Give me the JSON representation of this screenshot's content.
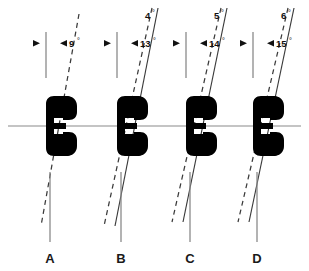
{
  "figure": {
    "type": "technical-cross-section-diagram",
    "background_color": "#ffffff",
    "centerline_color": "#8a8a8a",
    "reference_line_color": "#8a8a8a",
    "tilt_line_color": "#3a3a3a",
    "seal_fill_color": "#000000",
    "label_color": "#1a1a1a"
  },
  "centerline": {
    "label": "horizontal-centerline",
    "y": 126
  },
  "groups": [
    {
      "id": "A",
      "label": "A",
      "label_x": 50,
      "label_y": 260,
      "ref_x": 46,
      "leader_x": 50,
      "primary_angle": "9",
      "primary_angle_unit": "°",
      "primary_angle_x": 73,
      "primary_angle_y": 45,
      "secondary_angle": null,
      "secondary_angle_unit": null,
      "seal_center_x": 68,
      "tilt_dashed_deg": 9,
      "tilt_solid_deg": null
    },
    {
      "id": "B",
      "label": "B",
      "label_x": 121,
      "label_y": 260,
      "ref_x": 117,
      "leader_x": 121,
      "primary_angle": "13",
      "primary_angle_unit": "°",
      "primary_angle_x": 144,
      "primary_angle_y": 45,
      "secondary_angle": "4",
      "secondary_angle_unit": "°",
      "secondary_angle_x": 142,
      "secondary_angle_y": 17,
      "seal_center_x": 139,
      "tilt_dashed_deg": 13,
      "tilt_solid_deg": 9
    },
    {
      "id": "C",
      "label": "C",
      "label_x": 190,
      "label_y": 260,
      "ref_x": 186,
      "leader_x": 190,
      "primary_angle": "14",
      "primary_angle_unit": "°",
      "primary_angle_x": 213,
      "primary_angle_y": 45,
      "secondary_angle": "5",
      "secondary_angle_unit": "°",
      "secondary_angle_x": 211,
      "secondary_angle_y": 17,
      "seal_center_x": 208,
      "tilt_dashed_deg": 14,
      "tilt_solid_deg": 9
    },
    {
      "id": "D",
      "label": "D",
      "label_x": 257,
      "label_y": 260,
      "ref_x": 253,
      "leader_x": 257,
      "primary_angle": "15",
      "primary_angle_unit": "°",
      "primary_angle_x": 280,
      "primary_angle_y": 45,
      "secondary_angle": "6",
      "secondary_angle_unit": "°",
      "secondary_angle_x": 278,
      "secondary_angle_y": 17,
      "seal_center_x": 275,
      "tilt_dashed_deg": 15,
      "tilt_solid_deg": 9
    }
  ]
}
